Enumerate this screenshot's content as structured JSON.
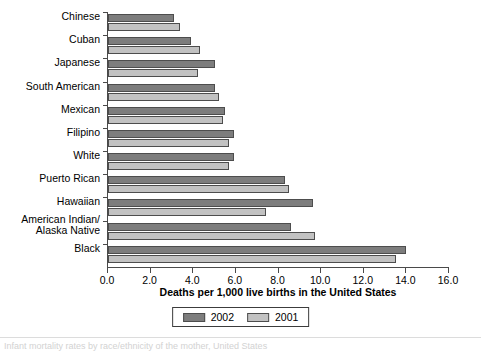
{
  "chart_data": {
    "type": "bar",
    "orientation": "horizontal",
    "title": "",
    "xlabel": "Deaths per 1,000 live births in the United States",
    "ylabel": "",
    "xlim": [
      0.0,
      16.0
    ],
    "xticks": [
      "0.0",
      "2.0",
      "4.0",
      "6.0",
      "8.0",
      "10.0",
      "12.0",
      "14.0",
      "16.0"
    ],
    "xtick_values": [
      0,
      2,
      4,
      6,
      8,
      10,
      12,
      14,
      16
    ],
    "grid": false,
    "legend_position": "bottom-center",
    "categories": [
      "Chinese",
      "Cuban",
      "Japanese",
      "South American",
      "Mexican",
      "Filipino",
      "White",
      "Puerto Rican",
      "Hawaiian",
      "American Indian/\nAlaska Native",
      "Black"
    ],
    "series": [
      {
        "name": "2002",
        "color": "#7d7d7d",
        "values": [
          3.1,
          3.9,
          5.0,
          5.0,
          5.5,
          5.9,
          5.9,
          8.3,
          9.6,
          8.6,
          14.0
        ]
      },
      {
        "name": "2001",
        "color": "#c2c2c2",
        "values": [
          3.4,
          4.3,
          4.2,
          5.2,
          5.4,
          5.7,
          5.7,
          8.5,
          7.4,
          9.7,
          13.5
        ]
      }
    ]
  },
  "category_labels": [
    {
      "line1": "Chinese",
      "line2": ""
    },
    {
      "line1": "Cuban",
      "line2": ""
    },
    {
      "line1": "Japanese",
      "line2": ""
    },
    {
      "line1": "South American",
      "line2": ""
    },
    {
      "line1": "Mexican",
      "line2": ""
    },
    {
      "line1": "Filipino",
      "line2": ""
    },
    {
      "line1": "White",
      "line2": ""
    },
    {
      "line1": "Puerto Rican",
      "line2": ""
    },
    {
      "line1": "Hawaiian",
      "line2": ""
    },
    {
      "line1": "American Indian/",
      "line2": "Alaska Native"
    },
    {
      "line1": "Black",
      "line2": ""
    }
  ],
  "legend": {
    "items": [
      {
        "label": "2002",
        "color": "#7d7d7d"
      },
      {
        "label": "2001",
        "color": "#c2c2c2"
      }
    ]
  },
  "axis": {
    "x_title": "Deaths per 1,000 live births in the United States"
  },
  "caption": {
    "text": "Infant mortality rates by race/ethnicity of the mother, United States"
  }
}
